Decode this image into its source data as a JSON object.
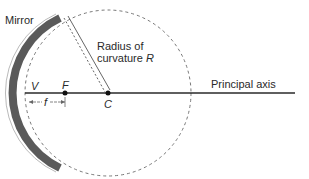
{
  "diagram": {
    "labels": {
      "mirror": "Mirror",
      "radius_line1": "Radius of",
      "radius_line2": "curvature",
      "radius_symbol": "R",
      "principal_axis": "Principal axis",
      "vertex": "V",
      "focal_point": "F",
      "center": "C",
      "focal_length": "f"
    },
    "colors": {
      "mirror_fill": "#5a5a5a",
      "line": "#2a2a2a",
      "dashed": "#777777"
    }
  }
}
